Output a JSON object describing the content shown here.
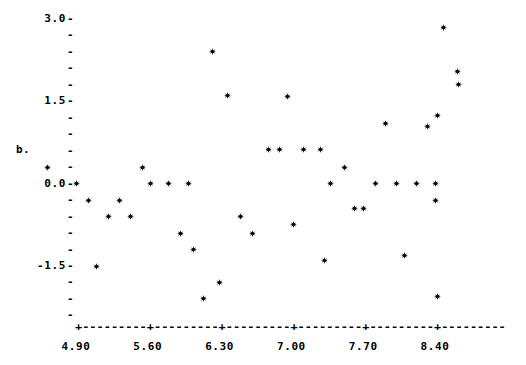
{
  "chart_data": {
    "type": "scatter",
    "title": "",
    "subtitle": "",
    "xlabel": "",
    "ylabel": "b.",
    "xlim": [
      4.55,
      8.95
    ],
    "ylim": [
      -2.45,
      3.1
    ],
    "grid": false,
    "legend": null,
    "marker": "star",
    "x_ticks": [
      4.9,
      5.6,
      6.3,
      7.0,
      7.7,
      8.4
    ],
    "x_tick_labels": [
      "4.90",
      "5.60",
      "6.30",
      "7.00",
      "7.70",
      "8.40"
    ],
    "x_minor_tick_count_between": 9,
    "y_ticks": [
      3.0,
      2.7,
      2.4,
      2.1,
      1.8,
      1.5,
      1.2,
      0.9,
      0.6,
      0.3,
      0.0,
      -0.3,
      -0.6,
      -0.9,
      -1.2,
      -1.5,
      -1.8,
      -2.1,
      -2.4
    ],
    "y_labeled_ticks": [
      3.0,
      1.5,
      0.0,
      -1.5
    ],
    "y_tick_labels": [
      "3.0",
      "1.5",
      "0.0",
      "-1.5"
    ],
    "points": [
      {
        "x": 4.62,
        "y": 0.3
      },
      {
        "x": 4.9,
        "y": 0.0
      },
      {
        "x": 5.02,
        "y": -0.3
      },
      {
        "x": 5.1,
        "y": -1.5
      },
      {
        "x": 5.22,
        "y": -0.6
      },
      {
        "x": 5.32,
        "y": -0.3
      },
      {
        "x": 5.43,
        "y": -0.6
      },
      {
        "x": 5.55,
        "y": 0.3
      },
      {
        "x": 5.63,
        "y": 0.0
      },
      {
        "x": 5.8,
        "y": 0.0
      },
      {
        "x": 5.92,
        "y": -0.9
      },
      {
        "x": 6.0,
        "y": 0.0
      },
      {
        "x": 6.05,
        "y": -1.2
      },
      {
        "x": 6.14,
        "y": -2.1
      },
      {
        "x": 6.23,
        "y": 2.4
      },
      {
        "x": 6.3,
        "y": -1.8
      },
      {
        "x": 6.38,
        "y": 1.6
      },
      {
        "x": 6.5,
        "y": -0.6
      },
      {
        "x": 6.62,
        "y": -0.9
      },
      {
        "x": 6.78,
        "y": 0.62
      },
      {
        "x": 6.88,
        "y": 0.62
      },
      {
        "x": 6.96,
        "y": 1.58
      },
      {
        "x": 7.02,
        "y": -0.75
      },
      {
        "x": 7.12,
        "y": 0.62
      },
      {
        "x": 7.28,
        "y": 0.62
      },
      {
        "x": 7.32,
        "y": -1.4
      },
      {
        "x": 7.38,
        "y": 0.0
      },
      {
        "x": 7.52,
        "y": 0.3
      },
      {
        "x": 7.62,
        "y": -0.45
      },
      {
        "x": 7.7,
        "y": -0.45
      },
      {
        "x": 7.82,
        "y": 0.0
      },
      {
        "x": 7.92,
        "y": 1.1
      },
      {
        "x": 8.02,
        "y": 0.0
      },
      {
        "x": 8.1,
        "y": -1.3
      },
      {
        "x": 8.22,
        "y": 0.0
      },
      {
        "x": 8.33,
        "y": 1.05
      },
      {
        "x": 8.4,
        "y": 0.0
      },
      {
        "x": 8.42,
        "y": 1.25
      },
      {
        "x": 8.4,
        "y": -0.3
      },
      {
        "x": 8.42,
        "y": -2.05
      },
      {
        "x": 8.48,
        "y": 2.85
      },
      {
        "x": 8.62,
        "y": 2.05
      },
      {
        "x": 8.63,
        "y": 1.8
      }
    ]
  },
  "axis": {
    "y_axis_title": "b.",
    "tick_dash": "-",
    "tick_cross": "+",
    "axis_dash_segment": "-"
  },
  "colors": {
    "background": "#ffffff",
    "foreground": "#000000",
    "marker": "#000000"
  }
}
